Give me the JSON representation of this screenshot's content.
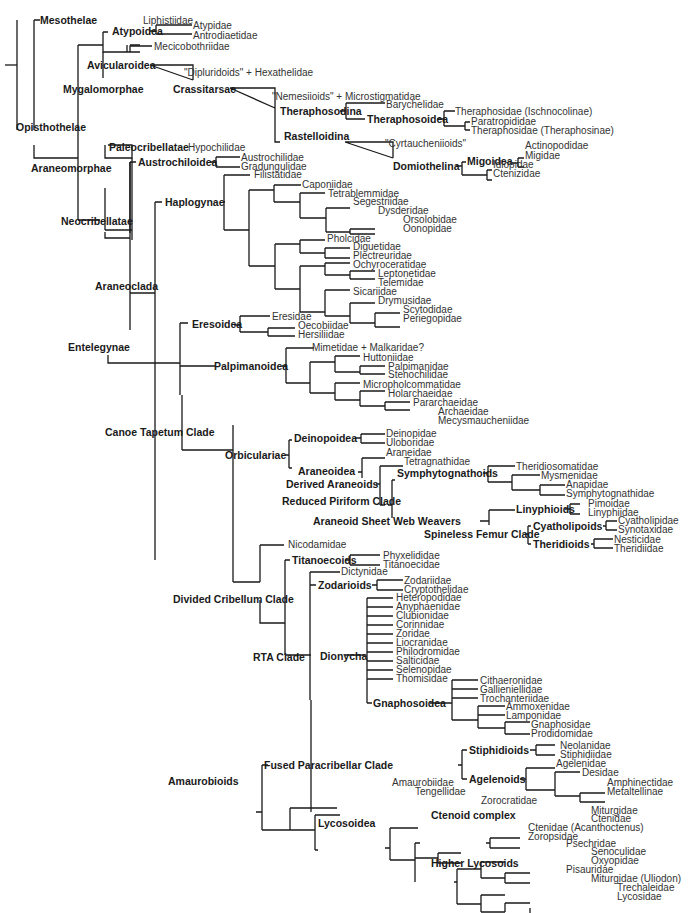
{
  "clades": {
    "mesothelae": "Mesothelae",
    "opisthothelae": "Opisthothelae",
    "mygalomorphae": "Mygalomorphae",
    "atypoidea": "Atypoidea",
    "avicularoidea": "Avicularoidea",
    "crassitarsae": "Crassitarsae",
    "theraphosodina": "Theraphosodina",
    "theraphosoidea": "Theraphosoidea",
    "rastelloidina": "Rastelloidina",
    "domiothelina": "Domiothelina",
    "migoidea": "Migoidea",
    "araneomorphae": "Araneomorphae",
    "paleocribellatae": "Paleocribellatae",
    "neocribellatae": "Neocribellatae",
    "austrochiloidea": "Austrochiloidea",
    "araneoclada": "Araneoclada",
    "haplogynae": "Haplogynae",
    "entelegynae": "Entelegynae",
    "eresoidea": "Eresoidea",
    "palpimanoidea": "Palpimanoidea",
    "canoe_tapetum": "Canoe Tapetum Clade",
    "orbiculariae": "Orbiculariae",
    "deinopoidea": "Deinopoidea",
    "araneoidea": "Araneoidea",
    "derived_araneoids": "Derived Araneoids",
    "reduced_piriform": "Reduced Piriform Clade",
    "symphytognathoids": "Symphytognathoids",
    "sheet_web_weavers": "Araneoid Sheet Web Weavers",
    "linyphioids": "Linyphioids",
    "spineless_femur": "Spineless Femur Clade",
    "cyatholipoids": "Cyatholipoids",
    "theridioids": "Theridioids",
    "divided_cribellum": "Divided Cribellum Clade",
    "titanoecoids": "Titanoecoids",
    "rta": "RTA Clade",
    "zodarioids": "Zodarioids",
    "dionycha": "Dionycha",
    "gnaphosoidea": "Gnaphosoidea",
    "amaurobioids": "Amaurobioids",
    "fused_paracribellar": "Fused Paracribellar Clade",
    "stiphidioids": "Stiphidioids",
    "agelenoids": "Agelenoids",
    "lycosoidea": "Lycosoidea",
    "ctenoid_complex": "Ctenoid complex",
    "higher_lycosoids": "Higher Lycosoids"
  },
  "taxa": {
    "liphistiidae": "Liphistiidae",
    "atypidae": "Atypidae",
    "antrodiaetidae": "Antrodiaetidae",
    "mecicobothriidae": "Mecicobothriidae",
    "dipluridoids": "\"Dipluridoids\" + Hexathelidae",
    "nemesiioids": "\"Nemesiioids\" + Microstigmatidae",
    "barychelidae": "Barychelidae",
    "theraphosidae_isch": "Theraphosidae (Ischnocolinae)",
    "paratropididae": "Paratropididae",
    "theraphosidae_ther": "Theraphosidae (Theraphosinae)",
    "cyrtaucheniioids": "\"Cyrtaucheniioids\"",
    "actinopodidae": "Actinopodidae",
    "migidae": "Migidae",
    "idiopidae": "Idiopidae",
    "ctenizidae": "Ctenizidae",
    "hypochilidae": "Hypochilidae",
    "austrochilidae": "Austrochilidae",
    "gradungulidae": "Gradungulidae",
    "filistatidae": "Filistatidae",
    "caponiidae": "Caponiidae",
    "tetrablemmidae": "Tetrablemmidae",
    "segestriidae": "Segestriidae",
    "dysderidae": "Dysderidae",
    "orsolobidae": "Orsolobidae",
    "oonopidae": "Oonopidae",
    "pholcidae": "Pholcidae",
    "diguetidae": "Diguetidae",
    "plectreuridae": "Plectreuridae",
    "ochyroceratidae": "Ochyroceratidae",
    "leptonetidae": "Leptonetidae",
    "telemidae": "Telemidae",
    "sicariidae": "Sicariidae",
    "drymusidae": "Drymusidae",
    "scytodidae": "Scytodidae",
    "periegopidae": "Periegopidae",
    "eresidae": "Eresidae",
    "oecobiidae": "Oecobiidae",
    "hersiliidae": "Hersiliidae",
    "mimetidae": "Mimetidae + Malkaridae?",
    "huttoniidae": "Huttoniidae",
    "palpimanidae": "Palpimanidae",
    "stenochilidae": "Stenochilidae",
    "micropholcommatidae": "Micropholcommatidae",
    "holarchaeidae": "Holarchaeidae",
    "pararchaeidae": "Pararchaeidae",
    "archaeidae": "Archaeidae",
    "mecysmaucheniidae": "Mecysmaucheniidae",
    "deinopidae": "Deinopidae",
    "uloboridae": "Uloboridae",
    "araneidae": "Araneidae",
    "tetragnathidae": "Tetragnathidae",
    "theridiosomatidae": "Theridiosomatidae",
    "mysmenidae": "Mysmenidae",
    "anapidae": "Anapidae",
    "symphytognathidae": "Symphytognathidae",
    "pimoidae": "Pimoidae",
    "linyphiidae": "Linyphiidae",
    "cyatholipidae": "Cyatholipidae",
    "synotaxidae": "Synotaxidae",
    "nesticidae": "Nesticidae",
    "theridiidae": "Theridiidae",
    "nicodamidae": "Nicodamidae",
    "phyxelididae": "Phyxelididae",
    "titanoecidae": "Titanoecidae",
    "dictynidae": "Dictynidae",
    "zodariidae": "Zodariidae",
    "cryptothelidae": "Cryptothelidae",
    "heteropodidae": "Heteropodidae",
    "anyphaenidae": "Anyphaenidae",
    "clubionidae": "Clubionidae",
    "corinnidae": "Corinnidae",
    "zoridae": "Zoridae",
    "liocranidae": "Liocranidae",
    "philodromidae": "Philodromidae",
    "salticidae": "Salticidae",
    "selenopidae": "Selenopidae",
    "thomisidae": "Thomisidae",
    "cithaeronidae": "Cithaeronidae",
    "gallieniellidae": "Gallieniellidae",
    "trochanteriidae": "Trochanteriidae",
    "ammoxenidae": "Ammoxenidae",
    "lamponidae": "Lamponidae",
    "gnaphosidae": "Gnaphosidae",
    "prodidomidae": "Prodidomidae",
    "neolanidae": "Neolanidae",
    "stiphidiidae": "Stiphidiidae",
    "agelenidae": "Agelenidae",
    "desidae": "Desidae",
    "amphinectidae": "Amphinectidae",
    "metaltellinae": "Metaltellinae",
    "amaurobiidae": "Amaurobiidae",
    "tengellidae": "Tengellidae",
    "zorocratidae": "Zorocratidae",
    "miturgidae": "Miturgidae",
    "ctenidae": "Ctenidae",
    "ctenidae_acan": "Ctenidae (Acanthoctenus)",
    "zoropsidae": "Zoropsidae",
    "psechridae": "Psechridae",
    "senoculidae": "Senoculidae",
    "oxyopidae": "Oxyopidae",
    "pisauridae": "Pisauridae",
    "miturgidae_uli": "Miturgidae (Uliodon)",
    "trechaleidae": "Trechaleidae",
    "lycosidae": "Lycosidae"
  }
}
